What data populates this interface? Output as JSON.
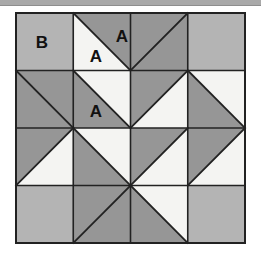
{
  "figure": {
    "top_rule": {
      "present": true,
      "color": "#a9a9a9"
    },
    "block": {
      "name": "pinwheel-star-quilt-block",
      "x": 16,
      "y": 13,
      "width": 229,
      "height": 230,
      "rows": 4,
      "cols": 4,
      "cell_width": 57.25,
      "cell_height": 57.5,
      "outline_color": "#222222",
      "outline_width": 2,
      "grid_line_color": "#222222",
      "grid_line_width": 1.6,
      "diagonal_line_color": "#222222",
      "diagonal_line_width": 1.8
    },
    "palette": {
      "light": "#f4f4f2",
      "medium": "#b4b4b4",
      "dark": "#969696",
      "outline": "#222222",
      "background": "#ffffff"
    },
    "legend_note": "A = half-square triangle patch, B = plain square patch",
    "cells": [
      {
        "row": 0,
        "col": 0,
        "type": "solid",
        "fill": "medium",
        "diagonal": "none"
      },
      {
        "row": 0,
        "col": 1,
        "type": "hst",
        "diagonal": "tl-br",
        "upper": "dark",
        "lower": "light"
      },
      {
        "row": 0,
        "col": 2,
        "type": "solid",
        "fill": "dark",
        "diagonal": "bl-tr"
      },
      {
        "row": 0,
        "col": 3,
        "type": "solid",
        "fill": "medium",
        "diagonal": "none"
      },
      {
        "row": 1,
        "col": 0,
        "type": "solid",
        "fill": "dark",
        "diagonal": "tl-br"
      },
      {
        "row": 1,
        "col": 1,
        "type": "hst",
        "diagonal": "tl-br",
        "upper": "light",
        "lower": "dark"
      },
      {
        "row": 1,
        "col": 2,
        "type": "hst",
        "diagonal": "bl-tr",
        "upper": "dark",
        "lower": "light"
      },
      {
        "row": 1,
        "col": 3,
        "type": "hst",
        "diagonal": "tl-br",
        "upper": "light",
        "lower": "dark"
      },
      {
        "row": 2,
        "col": 0,
        "type": "hst",
        "diagonal": "bl-tr",
        "upper": "dark",
        "lower": "light"
      },
      {
        "row": 2,
        "col": 1,
        "type": "hst",
        "diagonal": "tl-br",
        "upper": "light",
        "lower": "dark"
      },
      {
        "row": 2,
        "col": 2,
        "type": "hst",
        "diagonal": "bl-tr",
        "upper": "dark",
        "lower": "light"
      },
      {
        "row": 2,
        "col": 3,
        "type": "hst",
        "diagonal": "bl-tr",
        "upper": "dark",
        "lower": "light"
      },
      {
        "row": 3,
        "col": 0,
        "type": "solid",
        "fill": "medium",
        "diagonal": "none"
      },
      {
        "row": 3,
        "col": 1,
        "type": "solid",
        "fill": "dark",
        "diagonal": "bl-tr"
      },
      {
        "row": 3,
        "col": 2,
        "type": "hst",
        "diagonal": "tl-br",
        "upper": "light",
        "lower": "dark"
      },
      {
        "row": 3,
        "col": 3,
        "type": "solid",
        "fill": "medium",
        "diagonal": "none"
      }
    ],
    "labels": [
      {
        "text": "B",
        "x": 42,
        "y": 48,
        "name": "patch-label-b-r0c0"
      },
      {
        "text": "A",
        "x": 122,
        "y": 42,
        "name": "patch-label-a-r0c2"
      },
      {
        "text": "A",
        "x": 96,
        "y": 62,
        "name": "patch-label-a-r0c1"
      },
      {
        "text": "A",
        "x": 96,
        "y": 117,
        "name": "patch-label-a-r1c1"
      }
    ]
  }
}
